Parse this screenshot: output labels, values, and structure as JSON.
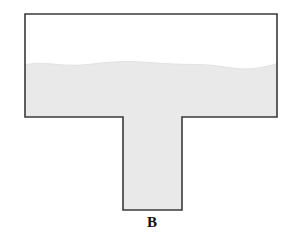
{
  "figure": {
    "canvas": {
      "width": 288,
      "height": 244,
      "background": "#ffffff"
    },
    "shape": {
      "name": "t-shaped-vessel",
      "type": "t-shape",
      "outline_color": "#3a3a3a",
      "outline_width": 1.6,
      "interior_color": "#ffffff",
      "horizontal_bar": {
        "left": 25,
        "right": 277,
        "top": 14,
        "bottom": 117
      },
      "stem": {
        "left": 123,
        "right": 182,
        "top": 117,
        "bottom": 210
      },
      "outline_points": "25,14 277,14 277,117 182,117 182,210 123,210 123,117 25,117"
    },
    "fill": {
      "name": "liquid-fill",
      "label": "liquid",
      "color": "#e9e9e9",
      "surface_style": "wavy",
      "surface_mean_y": 65,
      "surface_min_y": 61,
      "surface_max_y": 69,
      "surface_path": "M25,65 C34,62.5 43,63.2 52,64.0 C61,64.8 70,65.6 79,65.2 C88,64.8 96,63.4 105,62.6 C114,61.8 123,61.4 132,61.6 C141,61.8 150,62.6 159,63.2 C168,63.8 177,64.2 186,64.4 C195,64.6 204,64.4 213,65.4 C222,66.4 231,68.2 240,68.8 C249,69.4 258,68.4 267,66.2 C272,65.0 275,64.2 277,63.6",
      "fill_region_path": "M25,65 C34,62.5 43,63.2 52,64.0 C61,64.8 70,65.6 79,65.2 C88,64.8 96,63.4 105,62.6 C114,61.8 123,61.4 132,61.6 C141,61.8 150,62.6 159,63.2 C168,63.8 177,64.2 186,64.4 C195,64.6 204,64.4 213,65.4 C222,66.4 231,68.2 240,68.8 C249,69.4 258,68.4 267,66.2 C272,65.0 275,64.2 277,63.6 L277,117 L182,117 L182,210 L123,210 L123,117 L25,117 Z"
    },
    "labels": [
      {
        "name": "label-b",
        "text": "B",
        "x": 152,
        "y": 222,
        "font_size": 15,
        "color": "#111111"
      }
    ]
  }
}
